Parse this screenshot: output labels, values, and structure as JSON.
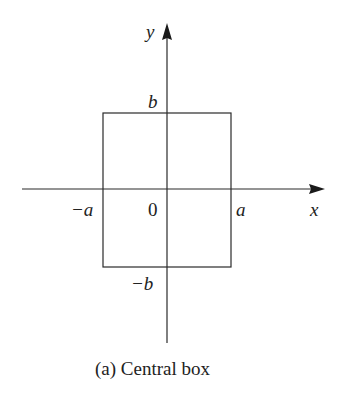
{
  "figure": {
    "caption": "(a) Central box",
    "axes": {
      "x_label": "x",
      "y_label": "y"
    },
    "ticks": {
      "neg_a": "−a",
      "origin": "0",
      "pos_a": "a",
      "pos_b": "b",
      "neg_b": "−b"
    },
    "colors": {
      "line": "#2a2a2a",
      "background": "#ffffff"
    }
  }
}
